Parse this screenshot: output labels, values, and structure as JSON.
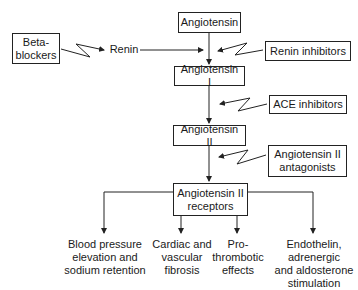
{
  "diagram": {
    "nodes": {
      "angiotensin": "Angiotensin",
      "renin": "Renin",
      "angiotensin_i": "Angiotensin I",
      "angiotensin_ii": "Angiotensin II",
      "angiotensin_ii_receptors_line1": "Angiotensin II",
      "angiotensin_ii_receptors_line2": "receptors"
    },
    "inhibitors": {
      "beta_blockers_line1": "Beta-",
      "beta_blockers_line2": "blockers",
      "renin_inhibitors": "Renin inhibitors",
      "ace_inhibitors": "ACE inhibitors",
      "at2_antagonists_line1": "Angiotensin II",
      "at2_antagonists_line2": "antagonists"
    },
    "outcomes": [
      {
        "lines": [
          "Blood pressure",
          "elevation and",
          "sodium retention"
        ]
      },
      {
        "lines": [
          "Cardiac and",
          "vascular",
          "fibrosis"
        ]
      },
      {
        "lines": [
          "Pro-",
          "thrombotic",
          "effects"
        ]
      },
      {
        "lines": [
          "Endothelin,",
          "adrenergic",
          "and aldosterone",
          "stimulation"
        ]
      }
    ],
    "colors": {
      "line": "#222222",
      "background": "#ffffff",
      "text": "#1a1a1a"
    }
  }
}
